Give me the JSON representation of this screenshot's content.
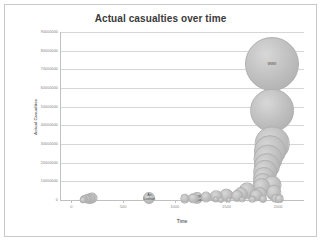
{
  "chart": {
    "title": "Actual casualties over time",
    "xlabel": "Time",
    "ylabel": "Actual Casualties"
  },
  "chart_data": {
    "type": "scatter",
    "title": "Actual casualties over time",
    "xlabel": "Time",
    "ylabel": "Actual Casualties",
    "xlim": [
      -100,
      2250
    ],
    "ylim": [
      0,
      90000000
    ],
    "grid": true,
    "legend": "none",
    "xticks": [
      0,
      500,
      1000,
      1500,
      2000
    ],
    "xtick_labels": [
      "0",
      "500",
      "1000",
      "1500",
      "2000"
    ],
    "yticks": [
      0,
      10000000,
      20000000,
      30000000,
      40000000,
      50000000,
      60000000,
      70000000,
      80000000,
      90000000
    ],
    "ytick_labels": [
      "0",
      "10000000",
      "20000000",
      "30000000",
      "40000000",
      "50000000",
      "60000000",
      "70000000",
      "80000000",
      "90000000"
    ],
    "bubble_color": "#bdbdbd",
    "points": [
      {
        "x": 1939,
        "y": 73000000,
        "size": 73000000,
        "label": "WWII"
      },
      {
        "x": 1938,
        "y": 48000000,
        "size": 48000000,
        "label": ""
      },
      {
        "x": 1945,
        "y": 30000000,
        "size": 30000000,
        "label": ""
      },
      {
        "x": 1920,
        "y": 26000000,
        "size": 26000000,
        "label": ""
      },
      {
        "x": 1905,
        "y": 22000000,
        "size": 21000000,
        "label": ""
      },
      {
        "x": 1890,
        "y": 18000000,
        "size": 17000000,
        "label": ""
      },
      {
        "x": 1875,
        "y": 15000000,
        "size": 14000000,
        "label": ""
      },
      {
        "x": 1860,
        "y": 12000000,
        "size": 12000000,
        "label": ""
      },
      {
        "x": 1850,
        "y": 9000000,
        "size": 10000000,
        "label": ""
      },
      {
        "x": 1840,
        "y": 7000000,
        "size": 8000000,
        "label": ""
      },
      {
        "x": 1945,
        "y": 8000000,
        "size": 9000000,
        "label": ""
      },
      {
        "x": 1960,
        "y": 4000000,
        "size": 6000000,
        "label": ""
      },
      {
        "x": 1820,
        "y": 3000000,
        "size": 5000000,
        "label": ""
      },
      {
        "x": 1790,
        "y": 2500000,
        "size": 4000000,
        "label": ""
      },
      {
        "x": 1700,
        "y": 5000000,
        "size": 7000000,
        "label": ""
      },
      {
        "x": 1640,
        "y": 3000000,
        "size": 5000000,
        "label": ""
      },
      {
        "x": 1600,
        "y": 2000000,
        "size": 3500000,
        "label": ""
      },
      {
        "x": 1500,
        "y": 2500000,
        "size": 4500000,
        "label": ""
      },
      {
        "x": 1400,
        "y": 2000000,
        "size": 4000000,
        "label": ""
      },
      {
        "x": 1300,
        "y": 1500000,
        "size": 3000000,
        "label": ""
      },
      {
        "x": 1220,
        "y": 1000000,
        "size": 3500000,
        "label": "Mongol\nConquests"
      },
      {
        "x": 1180,
        "y": 900000,
        "size": 2800000,
        "label": ""
      },
      {
        "x": 1100,
        "y": 800000,
        "size": 2200000,
        "label": ""
      },
      {
        "x": 755,
        "y": 1300000,
        "size": 3600000,
        "label": "An\nLushan"
      },
      {
        "x": 200,
        "y": 900000,
        "size": 3000000,
        "label": ""
      },
      {
        "x": 180,
        "y": 800000,
        "size": 2600000,
        "label": ""
      },
      {
        "x": 160,
        "y": 700000,
        "size": 2200000,
        "label": ""
      },
      {
        "x": 140,
        "y": 600000,
        "size": 1900000,
        "label": ""
      },
      {
        "x": 120,
        "y": 400000,
        "size": 1600000,
        "label": ""
      },
      {
        "x": 110,
        "y": 200000,
        "size": 1200000,
        "label": ""
      },
      {
        "x": 1400,
        "y": 300000,
        "size": 1000000,
        "label": ""
      },
      {
        "x": 1450,
        "y": 250000,
        "size": 900000,
        "label": ""
      },
      {
        "x": 1520,
        "y": 200000,
        "size": 800000,
        "label": ""
      },
      {
        "x": 1650,
        "y": 300000,
        "size": 1100000,
        "label": ""
      },
      {
        "x": 1750,
        "y": 400000,
        "size": 1400000,
        "label": ""
      },
      {
        "x": 1850,
        "y": 500000,
        "size": 1600000,
        "label": ""
      },
      {
        "x": 1980,
        "y": 900000,
        "size": 2400000,
        "label": ""
      },
      {
        "x": 2010,
        "y": 600000,
        "size": 1800000,
        "label": ""
      }
    ]
  }
}
